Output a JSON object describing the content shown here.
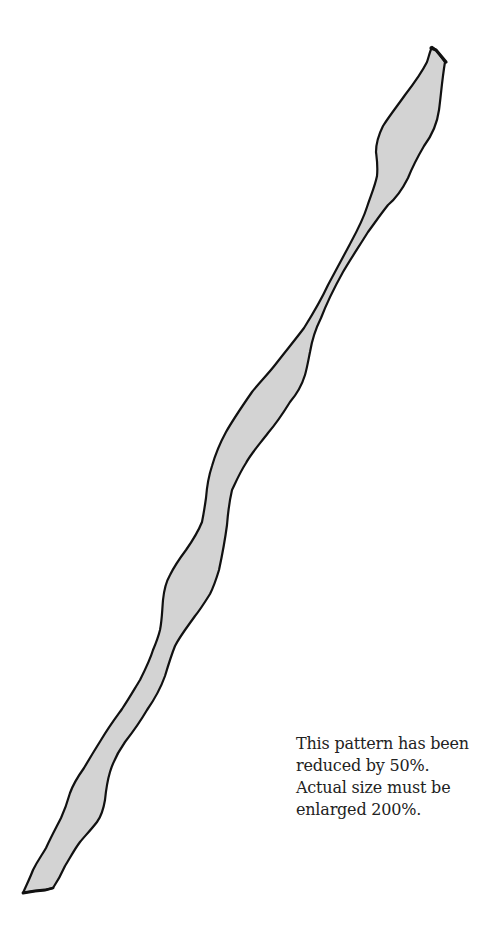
{
  "pattern": {
    "shape": "long wavy strip",
    "fill_color": "#d3d3d3",
    "stroke_color": "#111111",
    "background_color": "#ffffff"
  },
  "note": {
    "lines": [
      "This pattern has been",
      "reduced by 50%.",
      "Actual size must be",
      "enlarged 200%."
    ],
    "reduction_percent": "50%",
    "enlargement_percent": "200%"
  }
}
